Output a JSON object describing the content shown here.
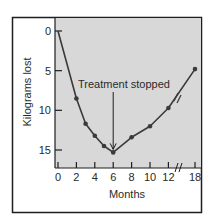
{
  "chart_data": {
    "type": "line",
    "title": "",
    "xlabel": "Months",
    "ylabel": "Kilograms lost",
    "x": [
      0,
      2,
      3,
      4,
      5,
      6,
      8,
      10,
      12,
      18
    ],
    "series": [
      {
        "name": "Kilograms lost",
        "values": [
          0,
          8.5,
          11.7,
          13.2,
          14.5,
          15.3,
          13.4,
          12.0,
          9.7,
          4.8
        ]
      }
    ],
    "x_ticks": [
      0,
      2,
      4,
      6,
      8,
      10,
      12,
      18
    ],
    "y_ticks": [
      0,
      5,
      10,
      15
    ],
    "ylim": [
      0,
      15
    ],
    "y_inverted": true,
    "x_axis_break_between": [
      12,
      18
    ],
    "grid": false,
    "legend": "none",
    "annotations": [
      {
        "text": "Treatment stopped",
        "x": 6,
        "type": "arrow"
      }
    ]
  },
  "colors": {
    "plot_background": "#d8d8d8",
    "line": "#3a3a3a",
    "frame": "#1e1e1e",
    "text": "#2a2a2a"
  }
}
